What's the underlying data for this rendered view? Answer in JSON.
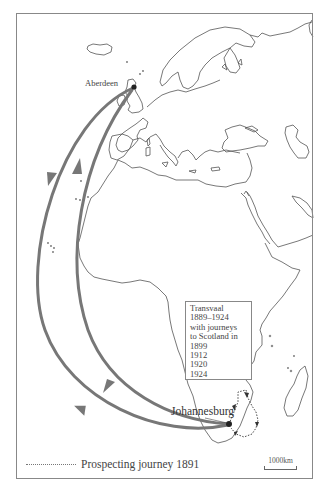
{
  "map": {
    "places": {
      "aberdeen": {
        "label": "Aberdeen"
      },
      "johannesburg": {
        "label": "Johannesburg"
      }
    },
    "info_box": {
      "lines": [
        "Transvaal",
        "1889–1924",
        "with journeys",
        "to Scotland in",
        "1899",
        "1912",
        "1920",
        "1924"
      ]
    },
    "legend": {
      "prospecting": {
        "label": "Prospecting journey 1891",
        "line_style": "dotted"
      }
    },
    "scale_bar": {
      "label": "1000km"
    },
    "colors": {
      "route": "#777777",
      "coastline": "#555555",
      "frame": "#888888",
      "city_dot": "#222222"
    }
  }
}
